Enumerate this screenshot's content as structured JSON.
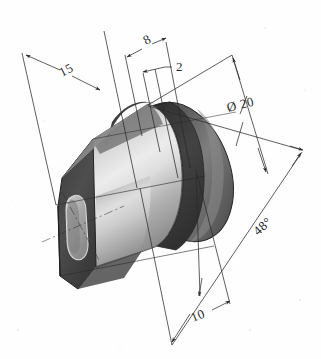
{
  "drawing": {
    "title": "Isometric engineering drawing of cylindrical flanged bushing",
    "background_color": "#fefefe",
    "line_color": "#2a2a2a",
    "part": {
      "name": "flanged-bushing",
      "description": "Hexagonal flange plate with slotted hole, cylindrical body, circumferential groove and rear disc flange",
      "shading": {
        "flange_face_color": "#4a4a4a",
        "flange_edge_color": "#3d3d3d",
        "cylinder_light_color": "#e8e8e8",
        "cylinder_mid_color": "#b8b8b8",
        "cylinder_dark_color": "#6e6e6e",
        "groove_color": "#3a3a3a",
        "rear_disc_color": "#555555",
        "rear_disc_highlight": "#8d8d8d",
        "slot_hole_color": "#9a9a9a"
      }
    },
    "dimensions": [
      {
        "id": "length-15",
        "label": "15",
        "value": "15",
        "text_x": 62,
        "text_y": 77,
        "rotation": -28,
        "description": "Overall length dimension at upper left"
      },
      {
        "id": "width-8",
        "label": "8",
        "value": "8",
        "text_x": 146,
        "text_y": 45,
        "rotation": -28,
        "description": "Dimension 8 at top center"
      },
      {
        "id": "groove-2",
        "label": "2",
        "value": "2",
        "text_x": 176,
        "text_y": 71,
        "rotation": 0,
        "description": "Groove width 2 with leader line"
      },
      {
        "id": "diameter-20",
        "label": "Ø 20",
        "value": "20",
        "symbol": "Ø",
        "text_x": 228,
        "text_y": 112,
        "rotation": -14,
        "description": "Diameter 20 of rear disc flange"
      },
      {
        "id": "angle-48",
        "label": "48°",
        "value": "48",
        "symbol": "°",
        "text_x": 258,
        "text_y": 236,
        "rotation": -42,
        "description": "Chamfer angle 48 degrees at lower right"
      },
      {
        "id": "depth-10",
        "label": "10",
        "value": "10",
        "text_x": 193,
        "text_y": 322,
        "rotation": -22,
        "description": "Dimension 10 at bottom"
      }
    ]
  }
}
